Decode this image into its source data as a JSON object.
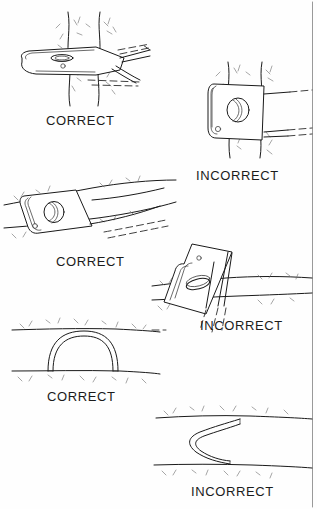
{
  "figure": {
    "background_color": "#fefefe",
    "ink_color": "#1a1a1a",
    "border_color": "#cfcfcf",
    "label_font_size_px": 13,
    "width_px": 317,
    "height_px": 509
  },
  "labels": {
    "correct": "CORRECT",
    "incorrect": "INCORRECT"
  },
  "panels": [
    {
      "id": "panel-1",
      "row": 1,
      "column": "left",
      "verdict": "CORRECT",
      "label": "CORRECT",
      "subject": "anchor-plate-edge-on-in-vertical-crack",
      "crack_orientation": "vertical",
      "description": "Flat anchor plate seen edge-on seated flush inside a vertical crack with the webbing pulling in line with the crack.",
      "label_position": {
        "x": 46,
        "y": 113
      }
    },
    {
      "id": "panel-2",
      "row": 1,
      "column": "right",
      "verdict": "INCORRECT",
      "label": "INCORRECT",
      "subject": "anchor-plate-face-on-in-vertical-crack",
      "crack_orientation": "vertical",
      "description": "Anchor plate turned face-on across a vertical crack so it cannot seat; webbing pulls the plate out of the crack.",
      "label_position": {
        "x": 196,
        "y": 168
      }
    },
    {
      "id": "panel-3",
      "row": 2,
      "column": "left",
      "verdict": "CORRECT",
      "label": "CORRECT",
      "subject": "anchor-plate-seated-in-horizontal-crack",
      "crack_orientation": "horizontal",
      "description": "Anchor plate set deep and flush inside a horizontal crack with the webbing running out along the crack line.",
      "label_position": {
        "x": 56,
        "y": 254
      }
    },
    {
      "id": "panel-4",
      "row": 2,
      "column": "right",
      "verdict": "INCORRECT",
      "label": "INCORRECT",
      "subject": "anchor-plate-protruding-from-horizontal-crack",
      "crack_orientation": "horizontal",
      "description": "Anchor plate tipped up and protruding out of the horizontal crack instead of sitting flush inside it.",
      "label_position": {
        "x": 200,
        "y": 318
      }
    },
    {
      "id": "panel-5",
      "row": 3,
      "column": "left",
      "verdict": "CORRECT",
      "label": "CORRECT",
      "subject": "webbing-arch-spanning-crack",
      "crack_orientation": "horizontal",
      "description": "Webbing threaded through the crack forms a smooth symmetrical arch bridging the gap between the two rock faces.",
      "label_position": {
        "x": 47,
        "y": 389
      }
    },
    {
      "id": "panel-6",
      "row": 3,
      "column": "right",
      "verdict": "INCORRECT",
      "label": "INCORRECT",
      "subject": "webbing-s-bend-across-crack",
      "crack_orientation": "horizontal",
      "description": "Webbing threaded in a sharp S-bend or zigzag across the crack, creating kinks instead of a smooth arch.",
      "label_position": {
        "x": 191,
        "y": 484
      }
    }
  ]
}
